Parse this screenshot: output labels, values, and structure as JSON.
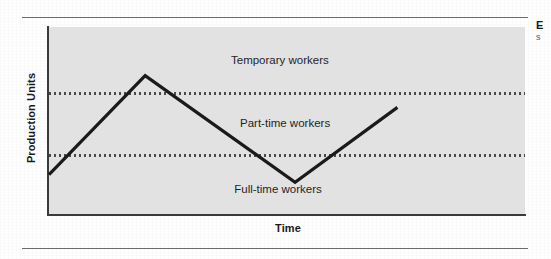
{
  "figure": {
    "plot_background": "#e2e2e2",
    "axis_color": "#3a3a3a",
    "series_color": "#1a1a1a",
    "threshold_color": "#4a4a4a",
    "rule_color": "#6c6c6c"
  },
  "margin_note": {
    "heading": "E",
    "subtext": "s"
  },
  "chart_data": {
    "type": "line",
    "title": "",
    "xlabel": "Time",
    "ylabel": "Production Units",
    "grid": false,
    "legend": "none",
    "xlim": [
      0,
      100
    ],
    "ylim": [
      0,
      100
    ],
    "x_tick_labels": [],
    "y_tick_labels": [],
    "series": [
      {
        "name": "Production output",
        "points": [
          {
            "x": 0,
            "y": 21
          },
          {
            "x": 20.2,
            "y": 74
          },
          {
            "x": 51.7,
            "y": 17
          },
          {
            "x": 73.2,
            "y": 57
          }
        ]
      }
    ],
    "threshold_lines": [
      {
        "name": "upper-threshold",
        "y": 64.5,
        "style": "dotted"
      },
      {
        "name": "lower-threshold",
        "y": 31.5,
        "style": "dotted"
      }
    ],
    "band_labels": [
      {
        "name": "temporary-workers",
        "text": "Temporary workers",
        "x": 48.5,
        "y": 82
      },
      {
        "name": "part-time-workers",
        "text": "Part-time workers",
        "x": 49.6,
        "y": 48
      },
      {
        "name": "full-time-workers",
        "text": "Full-time workers",
        "x": 48.1,
        "y": 13
      }
    ]
  }
}
